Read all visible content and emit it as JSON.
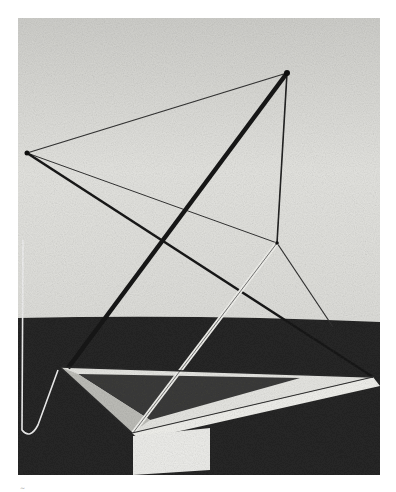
{
  "image": {
    "subject": "constructivist-sculpture-photograph",
    "description": "Black and white photograph of a linear spatial construction of rods and wires on a triangular base",
    "style": "monochrome",
    "colors": {
      "wall": "#d9d9d6",
      "floor": "#262626",
      "rod": "#1a1a1a",
      "base": "#e8e8e4"
    }
  },
  "footer_mark": "~"
}
